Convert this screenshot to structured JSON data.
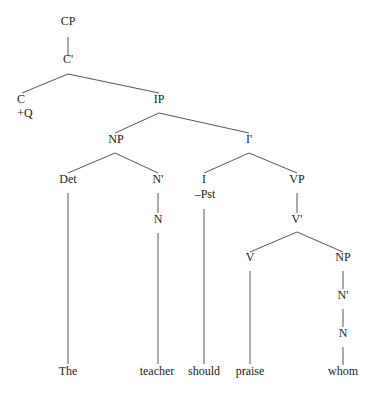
{
  "diagram": {
    "type": "syntax-tree",
    "line_color": "#555555",
    "text_color": "#1a1a1a",
    "nodes": [
      {
        "id": "CP",
        "label": "CP",
        "x": 68,
        "y": 22
      },
      {
        "id": "Cbar",
        "label": "C'",
        "x": 68,
        "y": 60
      },
      {
        "id": "C",
        "label": "C",
        "x": 21,
        "y": 100
      },
      {
        "id": "Cfeat",
        "label": "+Q",
        "x": 25,
        "y": 114
      },
      {
        "id": "IP",
        "label": "IP",
        "x": 159,
        "y": 100
      },
      {
        "id": "NP1",
        "label": "NP",
        "x": 116,
        "y": 140
      },
      {
        "id": "Ibar",
        "label": "I'",
        "x": 249,
        "y": 140
      },
      {
        "id": "Det",
        "label": "Det",
        "x": 68,
        "y": 180
      },
      {
        "id": "Nbar1",
        "label": "N'",
        "x": 158,
        "y": 180
      },
      {
        "id": "I",
        "label": "I",
        "x": 204,
        "y": 180
      },
      {
        "id": "Ifeat",
        "label": "–Pst",
        "x": 205,
        "y": 195
      },
      {
        "id": "VP",
        "label": "VP",
        "x": 297,
        "y": 180
      },
      {
        "id": "N1",
        "label": "N",
        "x": 158,
        "y": 220
      },
      {
        "id": "Vbar",
        "label": "V'",
        "x": 297,
        "y": 220
      },
      {
        "id": "V",
        "label": "V",
        "x": 250,
        "y": 258
      },
      {
        "id": "NP2",
        "label": "NP",
        "x": 343,
        "y": 258
      },
      {
        "id": "Nbar2",
        "label": "N'",
        "x": 343,
        "y": 296
      },
      {
        "id": "N2",
        "label": "N",
        "x": 343,
        "y": 334
      }
    ],
    "words": [
      {
        "label": "The",
        "x": 68,
        "y": 372
      },
      {
        "label": "teacher",
        "x": 157,
        "y": 372
      },
      {
        "label": "should",
        "x": 204,
        "y": 372
      },
      {
        "label": "praise",
        "x": 250,
        "y": 372
      },
      {
        "label": "whom",
        "x": 343,
        "y": 372
      }
    ],
    "edges": [
      [
        68,
        37,
        68,
        56
      ],
      [
        68,
        74,
        22,
        93
      ],
      [
        68,
        74,
        159,
        93
      ],
      [
        159,
        113,
        115,
        133
      ],
      [
        159,
        113,
        249,
        133
      ],
      [
        115,
        153,
        68,
        173
      ],
      [
        115,
        153,
        158,
        173
      ],
      [
        249,
        153,
        204,
        173
      ],
      [
        249,
        153,
        297,
        173
      ],
      [
        158,
        193,
        158,
        213
      ],
      [
        297,
        193,
        297,
        213
      ],
      [
        297,
        232,
        250,
        252
      ],
      [
        297,
        232,
        343,
        252
      ],
      [
        343,
        271,
        343,
        289
      ],
      [
        343,
        309,
        343,
        327
      ],
      [
        343,
        347,
        343,
        365
      ],
      [
        68,
        193,
        68,
        364
      ],
      [
        158,
        233,
        158,
        364
      ],
      [
        204,
        209,
        204,
        364
      ],
      [
        250,
        271,
        250,
        364
      ]
    ]
  }
}
